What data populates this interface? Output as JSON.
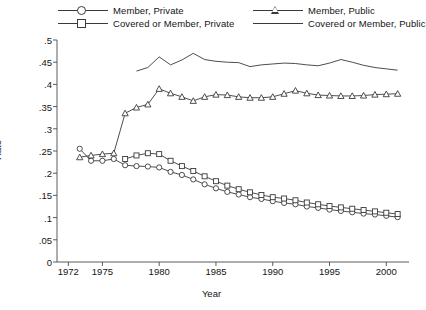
{
  "chart_data": {
    "type": "line",
    "title": "",
    "xlabel": "Year",
    "ylabel": "Rate",
    "xlim": [
      1971,
      2002
    ],
    "ylim": [
      0,
      0.5
    ],
    "xticks": [
      1972,
      1975,
      1980,
      1985,
      1990,
      1995,
      2000
    ],
    "yticks": [
      0,
      0.05,
      0.1,
      0.15,
      0.2,
      0.25,
      0.3,
      0.35,
      0.4,
      0.45,
      0.5
    ],
    "ytick_labels": [
      "0",
      ".05",
      ".1",
      ".15",
      ".2",
      ".25",
      ".3",
      ".35",
      ".4",
      ".45",
      ".5"
    ],
    "xtick_labels": [
      "1972",
      "1975",
      "1980",
      "1985",
      "1990",
      "1995",
      "2000"
    ],
    "grid": false,
    "legend_position": "top",
    "series": [
      {
        "name": "Member, Private",
        "marker": "circle",
        "color": "#3a3a3a",
        "x": [
          1973,
          1974,
          1975,
          1976,
          1977,
          1978,
          1979,
          1980,
          1981,
          1982,
          1983,
          1984,
          1985,
          1986,
          1987,
          1988,
          1989,
          1990,
          1991,
          1992,
          1993,
          1994,
          1995,
          1996,
          1997,
          1998,
          1999,
          2000,
          2001
        ],
        "values": [
          0.255,
          0.228,
          0.228,
          0.232,
          0.218,
          0.216,
          0.215,
          0.213,
          0.203,
          0.196,
          0.186,
          0.175,
          0.166,
          0.158,
          0.152,
          0.146,
          0.142,
          0.137,
          0.133,
          0.13,
          0.125,
          0.122,
          0.118,
          0.115,
          0.112,
          0.109,
          0.107,
          0.104,
          0.101
        ]
      },
      {
        "name": "Covered or Member, Private",
        "marker": "square",
        "color": "#3a3a3a",
        "x": [
          1977,
          1978,
          1979,
          1980,
          1981,
          1982,
          1983,
          1984,
          1985,
          1986,
          1987,
          1988,
          1989,
          1990,
          1991,
          1992,
          1993,
          1994,
          1995,
          1996,
          1997,
          1998,
          1999,
          2000,
          2001
        ],
        "values": [
          0.232,
          0.24,
          0.245,
          0.243,
          0.228,
          0.216,
          0.205,
          0.193,
          0.182,
          0.172,
          0.164,
          0.157,
          0.151,
          0.146,
          0.143,
          0.139,
          0.134,
          0.13,
          0.126,
          0.123,
          0.12,
          0.117,
          0.114,
          0.111,
          0.108
        ]
      },
      {
        "name": "Member, Public",
        "marker": "triangle",
        "color": "#3a3a3a",
        "x": [
          1973,
          1974,
          1975,
          1976,
          1977,
          1978,
          1979,
          1980,
          1981,
          1982,
          1983,
          1984,
          1985,
          1986,
          1987,
          1988,
          1989,
          1990,
          1991,
          1992,
          1993,
          1994,
          1995,
          1996,
          1997,
          1998,
          1999,
          2000,
          2001
        ],
        "values": [
          0.236,
          0.24,
          0.243,
          0.245,
          0.335,
          0.348,
          0.355,
          0.39,
          0.38,
          0.372,
          0.363,
          0.372,
          0.377,
          0.376,
          0.372,
          0.37,
          0.37,
          0.372,
          0.379,
          0.386,
          0.38,
          0.376,
          0.375,
          0.374,
          0.374,
          0.375,
          0.377,
          0.378,
          0.379
        ]
      },
      {
        "name": "Covered or Member, Public",
        "marker": "none",
        "color": "#3a3a3a",
        "x": [
          1978,
          1979,
          1980,
          1981,
          1982,
          1983,
          1984,
          1985,
          1986,
          1987,
          1988,
          1989,
          1990,
          1991,
          1992,
          1993,
          1994,
          1995,
          1996,
          1997,
          1998,
          1999,
          2000,
          2001
        ],
        "values": [
          0.43,
          0.438,
          0.462,
          0.444,
          0.455,
          0.47,
          0.456,
          0.452,
          0.45,
          0.449,
          0.44,
          0.444,
          0.446,
          0.448,
          0.447,
          0.444,
          0.442,
          0.448,
          0.456,
          0.45,
          0.443,
          0.438,
          0.435,
          0.432
        ]
      }
    ]
  },
  "legend": {
    "items": [
      {
        "label": "Member, Private",
        "marker": "circle",
        "col": 1,
        "row": 1
      },
      {
        "label": "Member, Public",
        "marker": "triangle",
        "col": 2,
        "row": 1
      },
      {
        "label": "Covered or Member, Private",
        "marker": "square",
        "col": 1,
        "row": 2
      },
      {
        "label": "Covered or Member, Public",
        "marker": "none",
        "col": 2,
        "row": 2
      }
    ]
  }
}
